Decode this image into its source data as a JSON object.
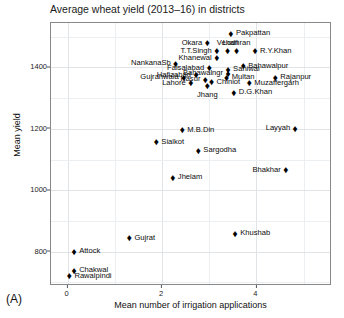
{
  "figure": {
    "panel_label": "(A)",
    "title": "Average wheat yield (2013–16) in districts"
  },
  "chart_data": {
    "type": "scatter",
    "title": "Average wheat yield (2013–16) in districts",
    "xlabel": "Mean number of irrigation applications",
    "ylabel": "Mean yield",
    "xlim": [
      -0.35,
      5.6
    ],
    "ylim": [
      688,
      1545
    ],
    "xticks": [
      0,
      2,
      4
    ],
    "yticks": [
      800,
      1000,
      1200,
      1400
    ],
    "grid": true,
    "legend": null,
    "marker": "diamond",
    "marker_color": "#000000",
    "points": [
      {
        "label": "Pakpattan",
        "x": 3.46,
        "y": 1510,
        "label_pos": "r"
      },
      {
        "label": "Okara",
        "x": 2.96,
        "y": 1479,
        "label_pos": "l"
      },
      {
        "label": "Lodhran",
        "x": 3.58,
        "y": 1453,
        "label_pos": "t"
      },
      {
        "label": "Vehari",
        "x": 3.39,
        "y": 1453,
        "label_pos": "t"
      },
      {
        "label": "R.Y.Khan",
        "x": 3.97,
        "y": 1453,
        "label_pos": "r"
      },
      {
        "label": "T.T.Singh",
        "x": 3.16,
        "y": 1453,
        "label_pos": "l"
      },
      {
        "label": "Khanewal",
        "x": 3.16,
        "y": 1430,
        "label_pos": "l"
      },
      {
        "label": "NankanaSb",
        "x": 2.29,
        "y": 1413,
        "label_pos": "l"
      },
      {
        "label": "Bahawalpur",
        "x": 3.72,
        "y": 1404,
        "label_pos": "r"
      },
      {
        "label": "Faisalabad",
        "x": 3.0,
        "y": 1398,
        "label_pos": "l"
      },
      {
        "label": "Sahiwal",
        "x": 3.4,
        "y": 1392,
        "label_pos": "r"
      },
      {
        "label": "Bahawalngr",
        "x": 3.4,
        "y": 1379,
        "label_pos": "l"
      },
      {
        "label": "Hafizabad",
        "x": 2.72,
        "y": 1375,
        "label_pos": "l"
      },
      {
        "label": "Gujranwala",
        "x": 2.46,
        "y": 1367,
        "label_pos": "l"
      },
      {
        "label": "Multan",
        "x": 3.37,
        "y": 1367,
        "label_pos": "r"
      },
      {
        "label": "Rajanpur",
        "x": 4.4,
        "y": 1367,
        "label_pos": "r"
      },
      {
        "label": "Kasur",
        "x": 2.92,
        "y": 1360,
        "label_pos": "l"
      },
      {
        "label": "Chiniot",
        "x": 3.05,
        "y": 1352,
        "label_pos": "r"
      },
      {
        "label": "Lahore",
        "x": 2.61,
        "y": 1348,
        "label_pos": "l"
      },
      {
        "label": "Muzaffergarh",
        "x": 3.85,
        "y": 1348,
        "label_pos": "r"
      },
      {
        "label": "Jhang",
        "x": 2.96,
        "y": 1339,
        "label_pos": "b"
      },
      {
        "label": "D.G.Khan",
        "x": 3.52,
        "y": 1317,
        "label_pos": "r"
      },
      {
        "label": "Layyah",
        "x": 4.82,
        "y": 1201,
        "label_pos": "l"
      },
      {
        "label": "M.B.Din",
        "x": 2.43,
        "y": 1195,
        "label_pos": "r"
      },
      {
        "label": "Sialkot",
        "x": 1.88,
        "y": 1157,
        "label_pos": "r"
      },
      {
        "label": "Sargodha",
        "x": 2.77,
        "y": 1128,
        "label_pos": "r"
      },
      {
        "label": "Bhakhar",
        "x": 4.62,
        "y": 1065,
        "label_pos": "l"
      },
      {
        "label": "Jhelam",
        "x": 2.23,
        "y": 1040,
        "label_pos": "r"
      },
      {
        "label": "Khushab",
        "x": 3.55,
        "y": 858,
        "label_pos": "r"
      },
      {
        "label": "Gujrat",
        "x": 1.31,
        "y": 843,
        "label_pos": "r"
      },
      {
        "label": "Attock",
        "x": 0.14,
        "y": 800,
        "label_pos": "r"
      },
      {
        "label": "Chakwal",
        "x": 0.14,
        "y": 737,
        "label_pos": "r"
      },
      {
        "label": "Rawalpindi",
        "x": 0.04,
        "y": 720,
        "label_pos": "r"
      }
    ]
  }
}
